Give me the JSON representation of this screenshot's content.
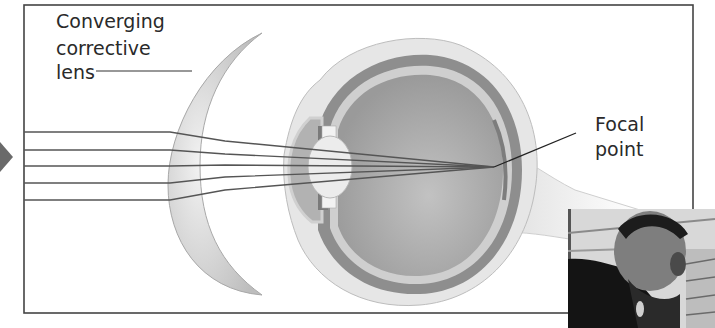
{
  "diagram": {
    "labels": {
      "lens_line1": "Converging",
      "lens_line2": "corrective",
      "lens_line3": "lens",
      "focal_line1": "Focal",
      "focal_line2": "point"
    },
    "rays": {
      "count": 6
    },
    "colors": {
      "frame": "#444444",
      "ray": "#555555",
      "lens_fill": "#d9d9d9",
      "eye_outer": "#e4e4e4",
      "eye_choroid": "#8c8c8c",
      "eye_interior": "#a8a8a8",
      "arrow": "#6a6a6a"
    }
  },
  "overlay": {
    "webcam_label": "presenter webcam"
  }
}
